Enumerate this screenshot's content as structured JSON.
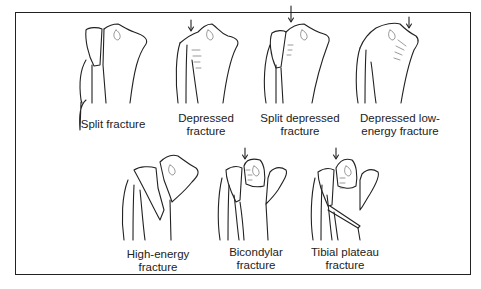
{
  "figure": {
    "panels": [
      {
        "id": "split",
        "label": "Split fracture",
        "arrow": false
      },
      {
        "id": "depressed",
        "label": "Depressed\nfracture",
        "arrow": true
      },
      {
        "id": "split-depressed",
        "label": "Split depressed\nfracture",
        "arrow": true
      },
      {
        "id": "depressed-low-energy",
        "label": "Depressed low-\nenergy fracture",
        "arrow": true
      },
      {
        "id": "high-energy",
        "label": "High-energy\nfracture",
        "arrow": false
      },
      {
        "id": "bicondylar",
        "label": "Bicondylar\nfracture",
        "arrow": true
      },
      {
        "id": "tibial-plateau",
        "label": "Tibial plateau\nfracture",
        "arrow": true
      }
    ]
  }
}
